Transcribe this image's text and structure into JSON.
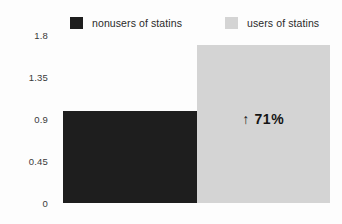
{
  "chart_data": {
    "type": "bar",
    "title": "",
    "xlabel": "",
    "ylabel": "",
    "categories": [
      "nonusers of statins",
      "users of statins"
    ],
    "values": [
      0.99,
      1.69
    ],
    "ylim": [
      0,
      1.8
    ],
    "yticks": [
      0,
      0.45,
      0.9,
      1.35,
      1.8
    ],
    "ytick_labels": [
      "0",
      "0.45",
      "0.9",
      "1.35",
      "1.8"
    ],
    "grid": false,
    "legend_position": "top",
    "series": [
      {
        "name": "nonusers of statins",
        "value": 0.99,
        "color": "#1e1e1e"
      },
      {
        "name": "users of statins",
        "value": 1.69,
        "color": "#d4d4d4"
      }
    ],
    "annotations": [
      {
        "text": "71%",
        "arrow": "↑",
        "full_text": "↑ 71%",
        "target_series": "users of statins"
      }
    ]
  },
  "legend": {
    "items": [
      {
        "label": "nonusers of statins",
        "color": "#1e1e1e"
      },
      {
        "label": "users of statins",
        "color": "#d4d4d4"
      }
    ]
  },
  "axis": {
    "ticks": [
      {
        "label": "1.8",
        "value": 1.8
      },
      {
        "label": "1.35",
        "value": 1.35
      },
      {
        "label": "0.9",
        "value": 0.9
      },
      {
        "label": "0.45",
        "value": 0.45
      },
      {
        "label": "0",
        "value": 0
      }
    ]
  },
  "colors": {
    "dark_bar": "#1e1e1e",
    "light_bar": "#d4d4d4",
    "background": "#fdfdfd",
    "text": "#2a2a2a"
  }
}
